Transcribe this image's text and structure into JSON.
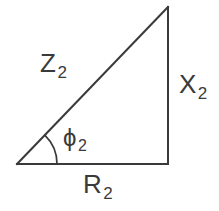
{
  "diagram": {
    "type": "right-triangle-impedance-phasor",
    "background_color": "#ffffff",
    "stroke_color": "#3a3a3a",
    "vertices": {
      "origin": {
        "x": 17,
        "y": 164
      },
      "apex": {
        "x": 168,
        "y": 7
      },
      "corner": {
        "x": 168,
        "y": 164
      }
    },
    "angle_arc": {
      "name": "phi-2",
      "radius": 40,
      "vertex": {
        "x": 17,
        "y": 164
      },
      "start_deg": 0,
      "end_deg": 46
    },
    "labels": {
      "hypotenuse": {
        "symbol": "Z",
        "subscript": "2"
      },
      "vertical": {
        "symbol": "X",
        "subscript": "2"
      },
      "base": {
        "symbol": "R",
        "subscript": "2"
      },
      "angle": {
        "symbol": "ϕ",
        "subscript": "2"
      }
    }
  }
}
